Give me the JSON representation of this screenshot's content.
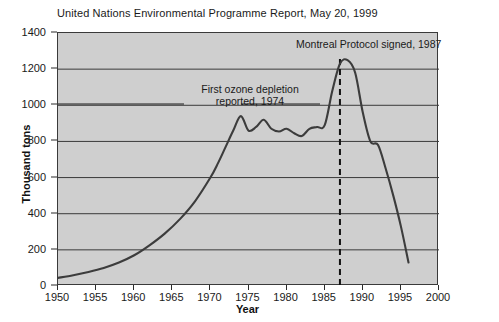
{
  "chart_data": {
    "type": "line",
    "title": "United Nations Environmental Programme Report, May 20, 1999",
    "xlabel": "Year",
    "ylabel": "Thousand tons",
    "xlim": [
      1950,
      2000
    ],
    "ylim": [
      0,
      1400
    ],
    "grid": true,
    "legend": null,
    "x_ticks": [
      1950,
      1955,
      1960,
      1965,
      1970,
      1975,
      1980,
      1985,
      1990,
      1995,
      2000
    ],
    "y_ticks": [
      0,
      200,
      400,
      600,
      800,
      1000,
      1200,
      1400
    ],
    "series": [
      {
        "name": "CFC production",
        "color": "#3c3c3c",
        "x": [
          1950,
          1952,
          1954,
          1956,
          1958,
          1960,
          1962,
          1964,
          1966,
          1968,
          1970,
          1971,
          1972,
          1973,
          1974,
          1975,
          1976,
          1977,
          1978,
          1979,
          1980,
          1981,
          1982,
          1983,
          1984,
          1985,
          1986,
          1987,
          1988,
          1989,
          1990,
          1991,
          1992,
          1993,
          1994,
          1995,
          1996
        ],
        "y": [
          45,
          60,
          78,
          100,
          130,
          170,
          225,
          290,
          370,
          470,
          600,
          680,
          770,
          860,
          940,
          860,
          880,
          920,
          870,
          855,
          870,
          845,
          830,
          870,
          880,
          890,
          1080,
          1230,
          1250,
          1180,
          960,
          800,
          780,
          650,
          500,
          330,
          130
        ]
      }
    ],
    "annotations": [
      {
        "id": "montreal",
        "text": "Montreal Protocol signed, 1987",
        "x": 1987,
        "marker": "dashed-vertical-line"
      },
      {
        "id": "ozone",
        "line1": "First ozone depletion",
        "line2": "reported, 1974",
        "x": 1974,
        "marker": "leader-line"
      }
    ],
    "colors": {
      "plot_background": "#cfcfcf",
      "page_background": "#ffffff",
      "line": "#3c3c3c",
      "grid": "#3a3a3a",
      "axis": "#2b2b2b",
      "text": "#1a1a1a"
    }
  }
}
